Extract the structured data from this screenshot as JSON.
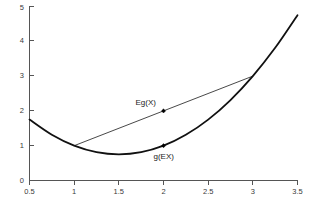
{
  "chart_data": {
    "type": "line",
    "title": "",
    "xlabel": "",
    "ylabel": "",
    "xlim": [
      0.5,
      3.5
    ],
    "ylim": [
      0,
      5
    ],
    "grid": false,
    "legend": "none",
    "x_ticks": [
      "0.5",
      "1",
      "1.5",
      "2",
      "2.5",
      "3",
      "3.5"
    ],
    "x_tick_values": [
      0.5,
      1,
      1.5,
      2,
      2.5,
      3,
      3.5
    ],
    "y_ticks": [
      "0",
      "1",
      "2",
      "3",
      "4",
      "5"
    ],
    "y_tick_values": [
      0,
      1,
      2,
      3,
      4,
      5
    ],
    "series": [
      {
        "name": "g(x)",
        "type": "curve",
        "description": "convex function g(x) = x^2 - 3x + 3",
        "x": [
          0.5,
          0.75,
          1.0,
          1.25,
          1.5,
          1.75,
          2.0,
          2.25,
          2.5,
          2.75,
          3.0,
          3.25,
          3.5
        ],
        "y": [
          1.75,
          1.3125,
          1.0,
          0.8125,
          0.75,
          0.8125,
          1.0,
          1.3125,
          1.75,
          2.3125,
          3.0,
          3.8125,
          4.75
        ]
      },
      {
        "name": "chord",
        "type": "line",
        "description": "chord joining (1,1) and (3,3)",
        "x": [
          1.0,
          3.0
        ],
        "y": [
          1.0,
          3.0
        ]
      }
    ],
    "points": [
      {
        "label": "Eg(X)",
        "x": 2.0,
        "y": 2.0,
        "label_dx": -28,
        "label_dy": -6
      },
      {
        "label": "g(EX)",
        "x": 2.0,
        "y": 1.0,
        "label_dx": -10,
        "label_dy": 13
      }
    ],
    "annotations": [
      {
        "text": "Eg(X)",
        "x": 2.0,
        "y": 2.0
      },
      {
        "text": "g(EX)",
        "x": 2.0,
        "y": 1.0
      }
    ],
    "colors": {
      "curve": "#111111",
      "chord": "#333333",
      "axis": "#555555",
      "text": "#3a3a3a",
      "background": "#ffffff"
    }
  }
}
